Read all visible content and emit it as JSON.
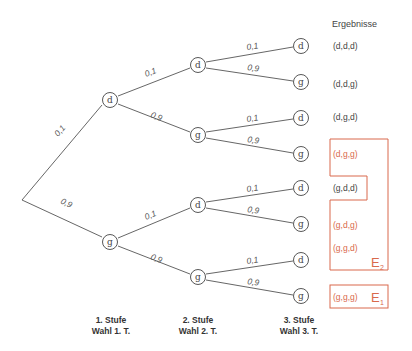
{
  "diagram": {
    "type": "probability-tree",
    "results_header": "Ergebnisse",
    "nodes": {
      "root": {
        "x": 22,
        "y": 200
      },
      "level1": [
        {
          "label": "d",
          "x": 110,
          "y": 100
        },
        {
          "label": "g",
          "x": 110,
          "y": 242
        }
      ],
      "level2": [
        {
          "label": "d",
          "x": 198,
          "y": 65
        },
        {
          "label": "g",
          "x": 198,
          "y": 135
        },
        {
          "label": "d",
          "x": 198,
          "y": 205
        },
        {
          "label": "g",
          "x": 198,
          "y": 277
        }
      ],
      "level3": [
        {
          "label": "d",
          "x": 301,
          "y": 46
        },
        {
          "label": "g",
          "x": 301,
          "y": 82
        },
        {
          "label": "d",
          "x": 301,
          "y": 118
        },
        {
          "label": "g",
          "x": 301,
          "y": 154
        },
        {
          "label": "d",
          "x": 301,
          "y": 188
        },
        {
          "label": "g",
          "x": 301,
          "y": 224
        },
        {
          "label": "d",
          "x": 301,
          "y": 260
        },
        {
          "label": "g",
          "x": 301,
          "y": 296
        }
      ]
    },
    "probabilities": {
      "level1": [
        "0,1",
        "0,9"
      ],
      "level2": [
        "0,1",
        "0,9",
        "0,1",
        "0,9"
      ],
      "level3": [
        "0,1",
        "0,9",
        "0,1",
        "0,9",
        "0,1",
        "0,9",
        "0,1",
        "0,9"
      ]
    },
    "results": [
      {
        "text": "(d,d,d)",
        "highlight": false
      },
      {
        "text": "(d,d,g)",
        "highlight": false
      },
      {
        "text": "(d,g,d)",
        "highlight": false
      },
      {
        "text": "(d,g,g)",
        "highlight": true
      },
      {
        "text": "(g,d,d)",
        "highlight": false
      },
      {
        "text": "(g,d,g)",
        "highlight": true
      },
      {
        "text": "(g,g,d)",
        "highlight": true
      },
      {
        "text": "(g,g,g)",
        "highlight": true
      }
    ],
    "events": {
      "E2": {
        "letter": "E",
        "sub": "2"
      },
      "E1": {
        "letter": "E",
        "sub": "1"
      }
    },
    "stages": [
      {
        "line1": "1. Stufe",
        "line2": "Wahl 1. T."
      },
      {
        "line1": "2. Stufe",
        "line2": "Wahl 2. T."
      },
      {
        "line1": "3. Stufe",
        "line2": "Wahl 3. T."
      }
    ],
    "colors": {
      "accent": "#d9694c",
      "line": "#555555"
    }
  }
}
